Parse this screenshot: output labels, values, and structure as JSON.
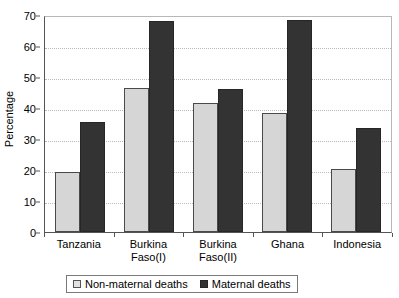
{
  "chart_data": {
    "type": "bar",
    "title": "",
    "subtitle": "",
    "xlabel": "",
    "ylabel": "Percentage",
    "ylim": [
      0,
      70
    ],
    "ytick_step": 10,
    "yticks": [
      0,
      10,
      20,
      30,
      40,
      50,
      60,
      70
    ],
    "ytick_labels": [
      "0",
      "10",
      "20",
      "30",
      "40",
      "50",
      "60",
      "70"
    ],
    "grid": "horizontal-dotted",
    "legend_position": "bottom-center",
    "categories": [
      "Tanzania",
      "Burkina Faso(I)",
      "Burkina Faso(II)",
      "Ghana",
      "Indonesia"
    ],
    "category_lines": [
      [
        "Tanzania",
        ""
      ],
      [
        "Burkina",
        "Faso(I)"
      ],
      [
        "Burkina",
        "Faso(II)"
      ],
      [
        "Ghana",
        ""
      ],
      [
        "Indonesia",
        ""
      ]
    ],
    "series": [
      {
        "name": "Non-maternal deaths",
        "color": "#d6d6d6",
        "values": [
          19.5,
          46.5,
          41.5,
          38.5,
          20.3
        ]
      },
      {
        "name": "Maternal deaths",
        "color": "#333333",
        "values": [
          35.5,
          68.0,
          46.0,
          68.3,
          33.5
        ]
      }
    ]
  },
  "legend": {
    "entries": [
      {
        "label": "Non-maternal deaths"
      },
      {
        "label": "Maternal deaths"
      }
    ]
  },
  "axes": {
    "y_title": "Percentage"
  }
}
